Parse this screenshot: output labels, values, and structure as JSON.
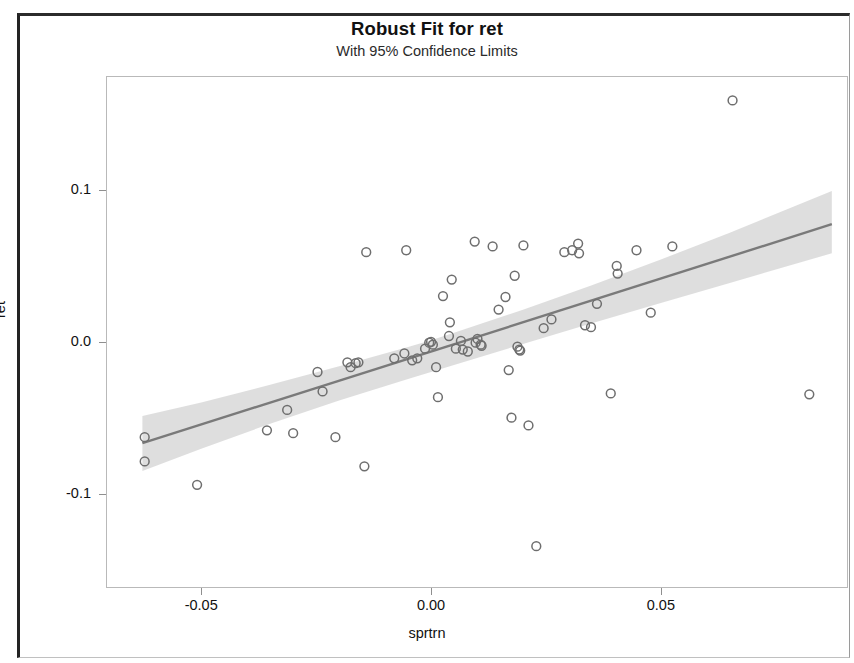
{
  "chart_data": {
    "type": "scatter",
    "title": "Robust Fit for ret",
    "subtitle": "With 95% Confidence Limits",
    "xlabel": "sprtrn",
    "ylabel": "ret",
    "xlim": [
      -0.0705,
      0.0905
    ],
    "ylim": [
      -0.1615,
      0.1744
    ],
    "xticks": [
      -0.05,
      0.0,
      0.05
    ],
    "xtick_labels": [
      "-0.05",
      "0.00",
      "0.05"
    ],
    "yticks": [
      0.1,
      0.0,
      -0.1
    ],
    "ytick_labels": [
      "0.1",
      "0.0",
      "-0.1"
    ],
    "grid": false,
    "legend": null,
    "marker": "open-circle",
    "marker_color": "#6e6e6e",
    "fit_line_color": "#7a7a7a",
    "confidence_band_color": "#d8d8d8",
    "confidence_level": 0.95,
    "fit": {
      "type": "robust-linear",
      "intercept": -0.0064,
      "slope": 0.9615,
      "x_start": -0.0628,
      "x_end": 0.0872
    },
    "confidence_band": {
      "x": [
        -0.0628,
        -0.05,
        -0.035,
        -0.02,
        -0.005,
        0.0,
        0.005,
        0.02,
        0.035,
        0.05,
        0.065,
        0.0872
      ],
      "upper": [
        -0.0489,
        -0.04,
        -0.0283,
        -0.0161,
        -0.0035,
        0.001,
        0.0059,
        0.0211,
        0.0373,
        0.0542,
        0.0718,
        0.0993
      ],
      "lower": [
        -0.0851,
        -0.0704,
        -0.054,
        -0.0387,
        -0.0245,
        -0.0199,
        -0.0153,
        -0.0014,
        0.0122,
        0.0256,
        0.0388,
        0.0583
      ]
    },
    "points": [
      {
        "x": -0.0623,
        "y": -0.0628
      },
      {
        "x": -0.0623,
        "y": -0.0788
      },
      {
        "x": -0.0509,
        "y": -0.0942
      },
      {
        "x": -0.0357,
        "y": -0.0583
      },
      {
        "x": -0.0313,
        "y": -0.0449
      },
      {
        "x": -0.03,
        "y": -0.0602
      },
      {
        "x": -0.0247,
        "y": -0.0199
      },
      {
        "x": -0.0236,
        "y": -0.0327
      },
      {
        "x": -0.0208,
        "y": -0.0628
      },
      {
        "x": -0.0182,
        "y": -0.0135
      },
      {
        "x": -0.0175,
        "y": -0.0167
      },
      {
        "x": -0.0164,
        "y": -0.0141
      },
      {
        "x": -0.0158,
        "y": -0.0135
      },
      {
        "x": -0.0145,
        "y": -0.082
      },
      {
        "x": -0.0141,
        "y": 0.059
      },
      {
        "x": -0.008,
        "y": -0.0109
      },
      {
        "x": -0.0058,
        "y": -0.0077
      },
      {
        "x": -0.0054,
        "y": 0.0603
      },
      {
        "x": -0.0041,
        "y": -0.0122
      },
      {
        "x": -0.003,
        "y": -0.0109
      },
      {
        "x": -0.0013,
        "y": -0.0045
      },
      {
        "x": -0.0004,
        "y": -0.0006
      },
      {
        "x": 0.0,
        "y": 0.0
      },
      {
        "x": 0.0004,
        "y": -0.0019
      },
      {
        "x": 0.0011,
        "y": -0.0167
      },
      {
        "x": 0.0015,
        "y": -0.0365
      },
      {
        "x": 0.0026,
        "y": 0.0301
      },
      {
        "x": 0.0039,
        "y": 0.0038
      },
      {
        "x": 0.0041,
        "y": 0.0128
      },
      {
        "x": 0.0045,
        "y": 0.041
      },
      {
        "x": 0.0054,
        "y": -0.0045
      },
      {
        "x": 0.0065,
        "y": 0.0006
      },
      {
        "x": 0.0069,
        "y": -0.0051
      },
      {
        "x": 0.008,
        "y": -0.0064
      },
      {
        "x": 0.0095,
        "y": 0.066
      },
      {
        "x": 0.0097,
        "y": -0.0006
      },
      {
        "x": 0.0101,
        "y": 0.0019
      },
      {
        "x": 0.0108,
        "y": -0.0019
      },
      {
        "x": 0.011,
        "y": -0.0026
      },
      {
        "x": 0.0134,
        "y": 0.0628
      },
      {
        "x": 0.0147,
        "y": 0.0212
      },
      {
        "x": 0.0162,
        "y": 0.0295
      },
      {
        "x": 0.0169,
        "y": -0.0186
      },
      {
        "x": 0.0175,
        "y": -0.05
      },
      {
        "x": 0.0182,
        "y": 0.0435
      },
      {
        "x": 0.0188,
        "y": -0.0032
      },
      {
        "x": 0.0192,
        "y": -0.0051
      },
      {
        "x": 0.0194,
        "y": -0.0058
      },
      {
        "x": 0.0201,
        "y": 0.0635
      },
      {
        "x": 0.0212,
        "y": -0.0551
      },
      {
        "x": 0.0229,
        "y": -0.1346
      },
      {
        "x": 0.0245,
        "y": 0.009
      },
      {
        "x": 0.0262,
        "y": 0.0147
      },
      {
        "x": 0.029,
        "y": 0.059
      },
      {
        "x": 0.0307,
        "y": 0.0603
      },
      {
        "x": 0.032,
        "y": 0.0647
      },
      {
        "x": 0.0322,
        "y": 0.0583
      },
      {
        "x": 0.0335,
        "y": 0.0109
      },
      {
        "x": 0.0348,
        "y": 0.0096
      },
      {
        "x": 0.0361,
        "y": 0.025
      },
      {
        "x": 0.0391,
        "y": -0.034
      },
      {
        "x": 0.0404,
        "y": 0.05
      },
      {
        "x": 0.0406,
        "y": 0.0449
      },
      {
        "x": 0.0447,
        "y": 0.0603
      },
      {
        "x": 0.0478,
        "y": 0.0192
      },
      {
        "x": 0.0525,
        "y": 0.0628
      },
      {
        "x": 0.0656,
        "y": 0.159
      },
      {
        "x": 0.0823,
        "y": -0.0346
      }
    ]
  },
  "axes": {
    "y_title": "ret",
    "x_title": "sprtrn"
  },
  "header": {
    "title": "Robust Fit for ret",
    "subtitle": "With 95% Confidence Limits"
  }
}
